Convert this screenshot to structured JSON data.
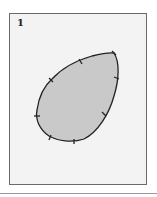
{
  "figure": {
    "label": "1",
    "shape": "teardrop-closed-curve",
    "fill_color": "#c9c9c9",
    "stroke_color": "#222222",
    "background_color": "#f3f3f3",
    "tick_mark_count": 8
  }
}
